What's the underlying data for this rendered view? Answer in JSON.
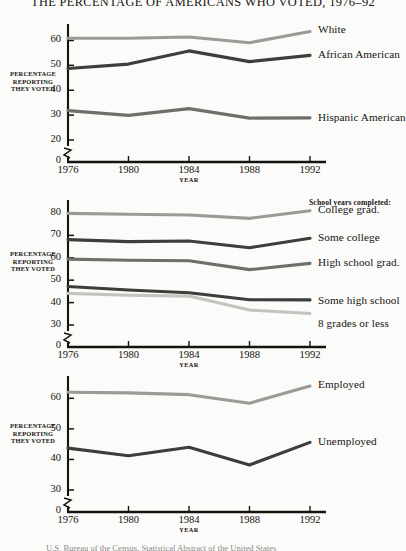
{
  "figure": {
    "title": "THE PERCENTAGE OF AMERICANS WHO VOTED, 1976–92",
    "caption": "U.S. Bureau of the Census, Statistical Abstract of the United States",
    "axis_label_y_line1": "PERCENTAGE",
    "axis_label_y_line2": "REPORTING",
    "axis_label_y_line3": "THEY VOTED",
    "axis_label_x": "YEAR",
    "zero_label": "0",
    "colors": {
      "light_gray": "#9a9a97",
      "pale_gray": "#c3c3bf",
      "mid_gray": "#6e6e6b",
      "dark_gray": "#3d3d3b",
      "axis": "#15130e",
      "background": "#fbfbfa"
    }
  },
  "chart_data": [
    {
      "type": "line",
      "title": "Voter turnout by race and ethnicity",
      "xlabel": "YEAR",
      "ylabel": "PERCENTAGE REPORTING THEY VOTED",
      "x": [
        1976,
        1980,
        1984,
        1988,
        1992
      ],
      "xticklabels": [
        "1976",
        "1980",
        "1984",
        "1988",
        "1992"
      ],
      "yticklabels": [
        "20",
        "30",
        "40",
        "50",
        "60"
      ],
      "yticks": [
        20,
        30,
        40,
        50,
        60
      ],
      "ylim": [
        20,
        65
      ],
      "axis_break": true,
      "grid": false,
      "legend": "right-inline",
      "series": [
        {
          "name": "White",
          "values": [
            60.9,
            60.9,
            61.4,
            59.1,
            63.6
          ],
          "color": "#9a9a97"
        },
        {
          "name": "African American",
          "values": [
            48.7,
            50.5,
            55.8,
            51.5,
            54.0
          ],
          "color": "#3d3d3b"
        },
        {
          "name": "Hispanic American",
          "values": [
            31.8,
            29.9,
            32.6,
            28.8,
            28.9
          ],
          "color": "#6e6e6b"
        }
      ]
    },
    {
      "type": "line",
      "title": "Voter turnout by school years completed",
      "xlabel": "YEAR",
      "ylabel": "PERCENTAGE REPORTING THEY VOTED",
      "legend_heading": "School years completed:",
      "x": [
        1976,
        1980,
        1984,
        1988,
        1992
      ],
      "xticklabels": [
        "1976",
        "1980",
        "1984",
        "1988",
        "1992"
      ],
      "yticklabels": [
        "30",
        "40",
        "50",
        "60",
        "70",
        "80"
      ],
      "yticks": [
        30,
        40,
        50,
        60,
        70,
        80
      ],
      "ylim": [
        30,
        84
      ],
      "axis_break": true,
      "grid": false,
      "legend": "right-inline",
      "series": [
        {
          "name": "College grad.",
          "values": [
            79.8,
            79.4,
            79.1,
            77.6,
            81.0
          ],
          "color": "#9a9a97"
        },
        {
          "name": "Some college",
          "values": [
            68.1,
            67.2,
            67.5,
            64.5,
            68.7
          ],
          "color": "#3d3d3b"
        },
        {
          "name": "High school grad.",
          "values": [
            59.4,
            58.9,
            58.7,
            54.7,
            57.5
          ],
          "color": "#6e6e6b"
        },
        {
          "name": "Some high school",
          "values": [
            47.2,
            45.6,
            44.4,
            41.3,
            41.2
          ],
          "color": "#3d3d3b"
        },
        {
          "name": "8 grades or less",
          "values": [
            44.1,
            43.3,
            42.9,
            36.7,
            35.1
          ],
          "color": "#c3c3bf"
        }
      ]
    },
    {
      "type": "line",
      "title": "Voter turnout by employment status",
      "xlabel": "YEAR",
      "ylabel": "PERCENTAGE REPORTING THEY VOTED",
      "x": [
        1976,
        1980,
        1984,
        1988,
        1992
      ],
      "xticklabels": [
        "1976",
        "1980",
        "1984",
        "1988",
        "1992"
      ],
      "yticklabels": [
        "30",
        "40",
        "50",
        "60"
      ],
      "yticks": [
        30,
        40,
        50,
        60
      ],
      "ylim": [
        30,
        66
      ],
      "axis_break": true,
      "grid": false,
      "legend": "right-inline",
      "series": [
        {
          "name": "Employed",
          "values": [
            62.0,
            61.8,
            61.2,
            58.4,
            64.0
          ],
          "color": "#9a9a97"
        },
        {
          "name": "Unemployed",
          "values": [
            43.7,
            41.2,
            44.0,
            38.2,
            45.6
          ],
          "color": "#3d3d3b"
        }
      ]
    }
  ]
}
